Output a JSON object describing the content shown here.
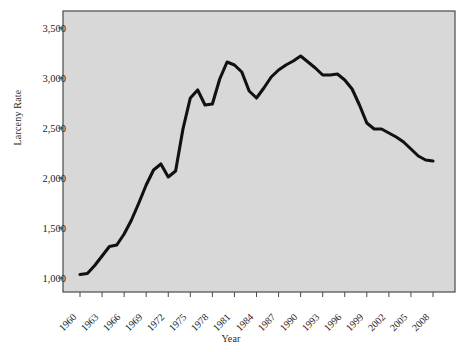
{
  "chart_data": {
    "type": "line",
    "title": "",
    "xlabel": "Year",
    "ylabel": "Larceny Rate",
    "xlim": [
      1960,
      2008
    ],
    "ylim": [
      850,
      3600
    ],
    "grid": false,
    "legend": "none",
    "series_color": "#111111",
    "plot_background": "#d8d8d8",
    "plot_border_color": "#4a4a4a",
    "y_ticks": [
      "1,000",
      "1,500",
      "2,000",
      "2,500",
      "3,000",
      "3,500"
    ],
    "y_tick_values": [
      1000,
      1500,
      2000,
      2500,
      3000,
      3500
    ],
    "x_ticks": [
      "1960",
      "1963",
      "1966",
      "1969",
      "1972",
      "1975",
      "1978",
      "1981",
      "1984",
      "1987",
      "1990",
      "1993",
      "1996",
      "1999",
      "2002",
      "2005",
      "2008"
    ],
    "x_tick_values": [
      1960,
      1963,
      1966,
      1969,
      1972,
      1975,
      1978,
      1981,
      1984,
      1987,
      1990,
      1993,
      1996,
      1999,
      2002,
      2005,
      2008
    ],
    "x": [
      1960,
      1961,
      1962,
      1963,
      1964,
      1965,
      1966,
      1967,
      1968,
      1969,
      1970,
      1971,
      1972,
      1973,
      1974,
      1975,
      1976,
      1977,
      1978,
      1979,
      1980,
      1981,
      1982,
      1983,
      1984,
      1985,
      1986,
      1987,
      1988,
      1989,
      1990,
      1991,
      1992,
      1993,
      1994,
      1995,
      1996,
      1997,
      1998,
      1999,
      2000,
      2001,
      2002,
      2003,
      2004,
      2005,
      2006,
      2007,
      2008
    ],
    "values": [
      1035,
      1045,
      1125,
      1220,
      1315,
      1330,
      1440,
      1580,
      1750,
      1930,
      2080,
      2140,
      2010,
      2070,
      2490,
      2800,
      2880,
      2730,
      2740,
      2990,
      3160,
      3130,
      3060,
      2870,
      2800,
      2900,
      3010,
      3080,
      3130,
      3170,
      3220,
      3160,
      3100,
      3030,
      3030,
      3040,
      2980,
      2890,
      2730,
      2550,
      2490,
      2490,
      2450,
      2410,
      2360,
      2290,
      2220,
      2180,
      2170
    ],
    "series": [
      {
        "name": "Larceny Rate",
        "values": [
          1035,
          1045,
          1125,
          1220,
          1315,
          1330,
          1440,
          1580,
          1750,
          1930,
          2080,
          2140,
          2010,
          2070,
          2490,
          2800,
          2880,
          2730,
          2740,
          2990,
          3160,
          3130,
          3060,
          2870,
          2800,
          2900,
          3010,
          3080,
          3130,
          3170,
          3220,
          3160,
          3100,
          3030,
          3030,
          3040,
          2980,
          2890,
          2730,
          2550,
          2490,
          2490,
          2450,
          2410,
          2360,
          2290,
          2220,
          2180,
          2170
        ]
      }
    ],
    "plot_area": {
      "left": 63,
      "top": 11,
      "right": 455,
      "bottom": 292
    }
  }
}
